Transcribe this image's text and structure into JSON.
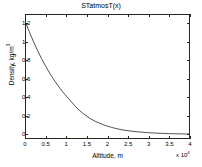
{
  "figure": {
    "width": 202,
    "height": 167,
    "background_color": "#ffffff",
    "axis_color": "#262626",
    "line_color": "#3d3d3d"
  },
  "chart_data": {
    "type": "line",
    "title": "STatmosT(x)",
    "xlabel": "Altitude, m",
    "ylabel": "Density, kg/m3",
    "ylabel_display": "Density, kg/m",
    "ylabel_exponent": "3",
    "x_exponent_label": "x 10",
    "x_exponent_power": "4",
    "x_scale_factor": 10000,
    "grid": false,
    "legend": null,
    "xlim": [
      0,
      40000
    ],
    "ylim": [
      -0.05,
      1.3
    ],
    "xticks": [
      0,
      5000,
      10000,
      15000,
      20000,
      25000,
      30000,
      35000,
      40000
    ],
    "xticklabels": [
      "0",
      "0.5",
      "1",
      "1.5",
      "2",
      "2.5",
      "3",
      "3.5",
      "4"
    ],
    "yticks": [
      0,
      0.2,
      0.4,
      0.6,
      0.8,
      1,
      1.2
    ],
    "yticklabels": [
      "0",
      "0.2",
      "0.4",
      "0.6",
      "0.8",
      "1",
      "1.2"
    ],
    "series": [
      {
        "name": "density",
        "x": [
          0,
          1000,
          2000,
          3000,
          4000,
          5000,
          6000,
          7000,
          8000,
          9000,
          10000,
          11000,
          12000,
          13000,
          14000,
          15000,
          16000,
          17000,
          18000,
          19000,
          20000,
          21000,
          22000,
          23000,
          24000,
          25000,
          26000,
          27000,
          28000,
          29000,
          30000,
          31000,
          32000,
          33000,
          34000,
          35000,
          36000,
          37000,
          38000,
          39000,
          40000
        ],
        "values": [
          1.225,
          1.112,
          1.007,
          0.909,
          0.819,
          0.736,
          0.66,
          0.59,
          0.526,
          0.467,
          0.414,
          0.365,
          0.312,
          0.267,
          0.228,
          0.195,
          0.166,
          0.142,
          0.122,
          0.104,
          0.088,
          0.075,
          0.064,
          0.054,
          0.046,
          0.039,
          0.034,
          0.029,
          0.025,
          0.021,
          0.018,
          0.015,
          0.013,
          0.011,
          0.0096,
          0.0082,
          0.007,
          0.006,
          0.0051,
          0.0043,
          0.004
        ]
      }
    ]
  }
}
